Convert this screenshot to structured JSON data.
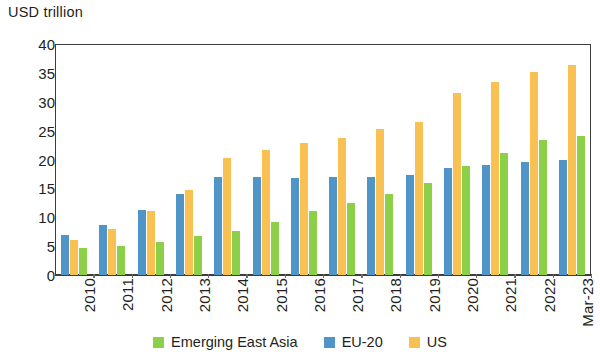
{
  "chart_data": {
    "type": "bar",
    "title": "",
    "ylabel": "USD trillion",
    "xlabel": "",
    "ylim": [
      0,
      40
    ],
    "yticks": [
      0,
      5,
      10,
      15,
      20,
      25,
      30,
      35,
      40
    ],
    "grid": false,
    "legend_position": "bottom",
    "categories": [
      "2010",
      "2011",
      "2012",
      "2013",
      "2014",
      "2015",
      "2016",
      "2017",
      "2018",
      "2019",
      "2020",
      "2021",
      "2022",
      "Mar-23"
    ],
    "series": [
      {
        "name": "EU-20",
        "color": "#4f95c7",
        "values": [
          7.0,
          8.7,
          11.2,
          14.0,
          17.0,
          17.0,
          16.8,
          17.0,
          17.0,
          17.3,
          18.5,
          19.0,
          19.6,
          20.0
        ]
      },
      {
        "name": "US",
        "color": "#f9c152",
        "values": [
          6.0,
          8.0,
          11.0,
          14.7,
          20.2,
          21.7,
          22.8,
          23.8,
          25.2,
          26.5,
          31.5,
          33.5,
          35.2,
          36.3
        ]
      },
      {
        "name": "Emerging East Asia",
        "color": "#8cd04a",
        "values": [
          4.7,
          5.1,
          5.8,
          6.8,
          7.7,
          9.1,
          11.0,
          12.5,
          14.1,
          15.9,
          18.9,
          21.2,
          23.4,
          24.0
        ]
      }
    ],
    "bar_order": [
      "EU-20",
      "US",
      "Emerging East Asia"
    ]
  },
  "axis": {
    "y_title": "USD trillion"
  },
  "legend": {
    "items": [
      {
        "label": "Emerging East Asia",
        "color": "#8cd04a",
        "key": "eea"
      },
      {
        "label": "EU-20",
        "color": "#4f95c7",
        "key": "eu"
      },
      {
        "label": "US",
        "color": "#f9c152",
        "key": "us"
      }
    ]
  }
}
